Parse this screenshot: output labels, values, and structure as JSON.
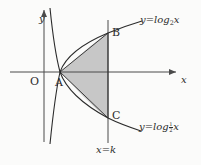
{
  "figure": {
    "background_color": "#fbfbfa",
    "shade_color": "#c7c7c7",
    "stroke_color": "#2b2b2b",
    "axes": {
      "x_axis_label": "x",
      "y_axis_label": "y",
      "origin_label": "O",
      "x_axis_y_px": 72,
      "y_axis_x_px": 44,
      "x_arrow": true,
      "y_arrow": true
    },
    "points": [
      {
        "name": "A",
        "label": "A",
        "x_px": 60,
        "y_px": 72,
        "desc": "intersection of both curves on the x-axis at x=1"
      },
      {
        "name": "B",
        "label": "B",
        "x_px": 108,
        "y_px": 33,
        "desc": "point on y=log_2 x at x=k"
      },
      {
        "name": "C",
        "label": "C",
        "x_px": 108,
        "y_px": 118,
        "desc": "point on y=log_(1/2) x at x=k"
      }
    ],
    "curves": [
      {
        "name": "log2",
        "equation_label": "y=log",
        "base_label": "2",
        "variable_label": "x",
        "label_x_px": 140,
        "label_y_px": 17
      },
      {
        "name": "log-half",
        "equation_label": "y=log",
        "base_numerator": "1",
        "base_denominator": "2",
        "variable_label": "x",
        "label_x_px": 139,
        "label_y_px": 124
      }
    ],
    "vertical_line": {
      "label_prefix": "x",
      "label_equals": "=",
      "label_value": "k",
      "full_label": "x=k",
      "x_px": 108,
      "label_x_px": 97,
      "label_y_px": 147
    },
    "shaded_region": {
      "name": "region-ABC",
      "vertices": [
        "A",
        "B",
        "C"
      ],
      "filled": true
    }
  }
}
